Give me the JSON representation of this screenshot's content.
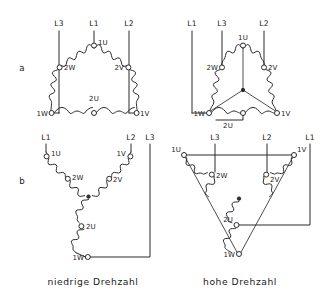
{
  "figure": {
    "background_color": "#ffffff",
    "line_color": "#2b2b2b",
    "rows": [
      {
        "id": "a",
        "label": "a"
      },
      {
        "id": "b",
        "label": "b"
      }
    ],
    "columns": [
      {
        "id": "low",
        "caption": "niedrige Drehzahl"
      },
      {
        "id": "high",
        "caption": "hohe Drehzahl"
      }
    ]
  },
  "diagrams": {
    "a_low": {
      "name": "delta-connection-low-speed",
      "row": "a",
      "column": "low",
      "supply_labels": [
        "L3",
        "L1",
        "L2"
      ],
      "terminal_labels": [
        "1U",
        "2W",
        "2V",
        "2U",
        "1W",
        "1V"
      ],
      "topology": "delta"
    },
    "a_high": {
      "name": "double-star-connection-high-speed",
      "row": "a",
      "column": "high",
      "supply_labels": [
        "L1",
        "L3",
        "L2"
      ],
      "terminal_labels": [
        "1U",
        "2W",
        "2V",
        "1W",
        "1V",
        "2U"
      ],
      "topology": "delta-with-star-point"
    },
    "b_low": {
      "name": "star-connection-low-speed",
      "row": "b",
      "column": "low",
      "supply_labels": [
        "L1",
        "L2",
        "L3"
      ],
      "terminal_labels": [
        "1U",
        "2W",
        "1V",
        "2V",
        "2U",
        "1W"
      ],
      "topology": "star"
    },
    "b_high": {
      "name": "inverted-delta-connection-high-speed",
      "row": "b",
      "column": "high",
      "supply_labels": [
        "L3",
        "L2",
        "L1"
      ],
      "terminal_labels": [
        "1U",
        "2W",
        "1V",
        "2V",
        "2U",
        "1W"
      ],
      "topology": "inverted-delta-with-star-point"
    }
  },
  "labels": {
    "row_a": "a",
    "row_b": "b",
    "caption_low": "niedrige Drehzahl",
    "caption_high": "hohe Drehzahl",
    "a_low": {
      "L3": "L3",
      "L1": "L1",
      "L2": "L2",
      "t1U": "1U",
      "t2W": "2W",
      "t2V": "2V",
      "t2U": "2U",
      "t1W": "1W",
      "t1V": "1V"
    },
    "a_high": {
      "L1": "L1",
      "L3": "L3",
      "L2": "L2",
      "t1U": "1U",
      "t2W": "2W",
      "t2V": "2V",
      "t1W": "1W",
      "t1V": "1V",
      "t2U": "2U"
    },
    "b_low": {
      "L1": "L1",
      "L2": "L2",
      "L3": "L3",
      "t1U": "1U",
      "t2W": "2W",
      "t1V": "1V",
      "t2V": "2V",
      "t2U": "2U",
      "t1W": "1W"
    },
    "b_high": {
      "L3": "L3",
      "L2": "L2",
      "L1": "L1",
      "t1U": "1U",
      "t2W": "2W",
      "t1V": "1V",
      "t2V": "2V",
      "t2U": "2U",
      "t1W": "1W"
    }
  }
}
